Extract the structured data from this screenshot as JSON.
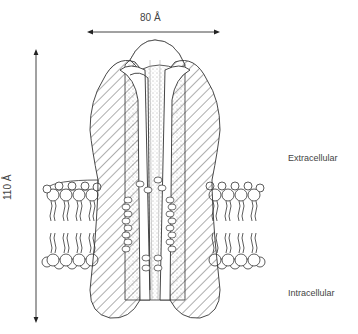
{
  "diagram": {
    "dimensions": {
      "width_label": "80 Å",
      "height_label": "110 Å"
    },
    "regions": {
      "top_label": "Extracellular",
      "bottom_label": "Intracellular"
    },
    "components": [
      {
        "name": "protein-subunits",
        "style": "hatched"
      },
      {
        "name": "central-pore",
        "style": "stippled"
      },
      {
        "name": "lipid-bilayer-left"
      },
      {
        "name": "lipid-bilayer-right"
      },
      {
        "name": "helix-coils-left"
      },
      {
        "name": "helix-coils-right"
      }
    ],
    "colors": {
      "line": "#333333",
      "background": "#ffffff"
    }
  }
}
